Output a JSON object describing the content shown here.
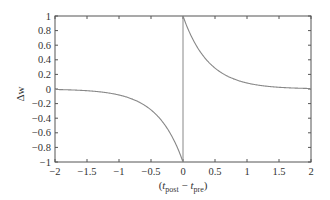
{
  "chart_data": {
    "type": "line",
    "title": "",
    "xlabel": "(t_post − t_pre)",
    "xlabel_parts": {
      "open": "(",
      "t1": "t",
      "sub1": "post",
      "minus": " − ",
      "t2": "t",
      "sub2": "pre",
      "close": ")"
    },
    "ylabel": "Δw",
    "xlim": [
      -2,
      2
    ],
    "ylim": [
      -1,
      1
    ],
    "grid": false,
    "legend": null,
    "x_ticks": [
      -2,
      -1.5,
      -1,
      -0.5,
      0,
      0.5,
      1,
      1.5,
      2
    ],
    "x_tick_labels": [
      "−2",
      "−1.5",
      "−1",
      "−0.5",
      "0",
      "0.5",
      "1",
      "1.5",
      "2"
    ],
    "y_ticks": [
      1,
      0.8,
      0.6,
      0.4,
      0.2,
      0,
      -0.2,
      -0.4,
      -0.6,
      -0.8,
      -1
    ],
    "y_tick_labels": [
      "1",
      "0.8",
      "0.6",
      "0.4",
      "0.2",
      "0",
      "−0.2",
      "−0.4",
      "−0.6",
      "−0.8",
      "−1"
    ],
    "series": [
      {
        "name": "STDP window",
        "color": "#888888",
        "x": [
          -2,
          -1.75,
          -1.5,
          -1.25,
          -1,
          -0.75,
          -0.5,
          -0.25,
          -0.1,
          0,
          0,
          0.1,
          0.25,
          0.5,
          0.75,
          1,
          1.25,
          1.5,
          1.75,
          2
        ],
        "values": [
          -0.01,
          -0.01,
          -0.02,
          -0.04,
          -0.08,
          -0.15,
          -0.29,
          -0.54,
          -0.78,
          -1,
          1,
          0.78,
          0.54,
          0.29,
          0.15,
          0.08,
          0.04,
          0.02,
          0.01,
          0.01
        ],
        "formula": "Δw = exp(-t/0.4) for t>0; -exp(t/0.4) for t<0",
        "tau": 0.4
      }
    ],
    "annotations": [
      {
        "type": "vertical-line",
        "x": 0,
        "from": -1,
        "to": 1
      }
    ]
  }
}
